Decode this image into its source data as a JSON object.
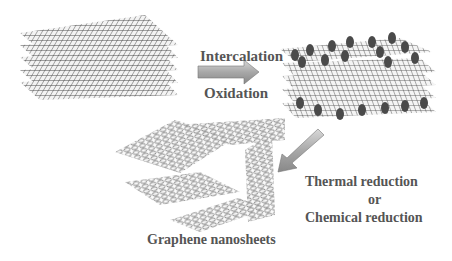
{
  "diagram": {
    "stages": [
      {
        "id": "graphite",
        "label": "",
        "description": "stacked graphene layers (graphite)"
      },
      {
        "id": "graphite-oxide",
        "label": "",
        "description": "intercalated / oxidized stacked layers with functional groups"
      },
      {
        "id": "graphene",
        "label": "Graphene nanosheets",
        "description": "exfoliated graphene sheets"
      }
    ],
    "steps": [
      {
        "from": "graphite",
        "to": "graphite-oxide",
        "labels": [
          "Intercalation",
          "Oxidation"
        ]
      },
      {
        "from": "graphite-oxide",
        "to": "graphene",
        "labels": [
          "Thermal reduction",
          "or",
          "Chemical reduction"
        ]
      }
    ],
    "colors": {
      "text": "#555555",
      "arrow": "#9a9a9a",
      "lattice": "#333333",
      "groups": "#4a4a4a"
    }
  },
  "text": {
    "step1_top": "Intercalation",
    "step1_bottom": "Oxidation",
    "step2_line1": "Thermal reduction",
    "step2_line2": "or",
    "step2_line3": "Chemical reduction",
    "product": "Graphene nanosheets"
  }
}
